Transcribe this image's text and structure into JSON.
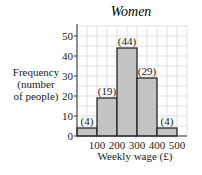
{
  "chart_data": {
    "type": "bar",
    "subtype": "histogram",
    "title": "Women",
    "xlabel": "Weekly wage (£)",
    "ylabel": "Frequency (number of people)",
    "ylabel_lines": [
      "Frequency",
      "(number",
      "of people)"
    ],
    "bins": [
      [
        0,
        100
      ],
      [
        100,
        200
      ],
      [
        200,
        300
      ],
      [
        300,
        400
      ],
      [
        400,
        500
      ]
    ],
    "categories": [
      "0-100",
      "100-200",
      "200-300",
      "300-400",
      "400-500"
    ],
    "values": [
      4,
      19,
      44,
      29,
      4
    ],
    "value_labels": [
      "(4)",
      "(19)",
      "(44)",
      "(29)",
      "(4)"
    ],
    "xticks": [
      100,
      200,
      300,
      400,
      500
    ],
    "xtick_labels": [
      "100",
      "200",
      "300",
      "400",
      "500"
    ],
    "yticks": [
      0,
      10,
      20,
      30,
      40,
      50
    ],
    "ytick_labels": [
      "0",
      "10",
      "20",
      "30",
      "40",
      "50"
    ],
    "xlim": [
      0,
      550
    ],
    "ylim": [
      0,
      55
    ],
    "grid": true,
    "grid_minor_step": {
      "x": 50,
      "y": 5
    },
    "legend": null,
    "colors": {
      "bar_fill": "#c4c4c4",
      "bar_edge": "#1a1a1a",
      "grid": "#d9d9d9",
      "axis": "#333333"
    }
  }
}
